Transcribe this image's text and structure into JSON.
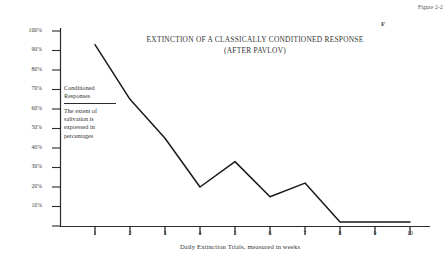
{
  "figure": {
    "caption": "Figure 2-2",
    "stray_mark": "F"
  },
  "chart_data": {
    "type": "line",
    "title": "EXTINCTION OF A CLASSICALLY CONDITIONED RESPONSE",
    "subtitle": "(AFTER PAVLOV)",
    "xlabel": "Daily Extinction Trials, measured in weeks",
    "ylabel": "Conditioned Responses",
    "x": [
      1,
      2,
      3,
      4,
      5,
      6,
      7,
      8,
      9,
      10
    ],
    "categories": [
      "1",
      "2",
      "3",
      "4",
      "5",
      "6",
      "7",
      "8",
      "9",
      "10"
    ],
    "values": [
      93,
      65,
      45,
      20,
      33,
      15,
      22,
      2,
      2,
      2
    ],
    "series": [
      {
        "name": "Conditioned Responses",
        "values": [
          93,
          65,
          45,
          20,
          33,
          15,
          22,
          2,
          2,
          2
        ]
      }
    ],
    "ylim": [
      0,
      100
    ],
    "xlim": [
      0,
      10
    ],
    "ytick_labels": [
      "100%",
      "90%",
      "80%",
      "70%",
      "60%",
      "50%",
      "40%",
      "30%",
      "20%",
      "10%"
    ],
    "ytick_values": [
      100,
      90,
      80,
      70,
      60,
      50,
      40,
      30,
      20,
      10
    ],
    "grid": false,
    "legend": "none",
    "line_color": "#1a1a1a",
    "axis_color": "#2b2b2b"
  },
  "annotation": {
    "heading_line1": "Conditioned",
    "heading_line2": "Responses",
    "body_line1": "The extent of",
    "body_line2": "salivation is",
    "body_line3": "expressed in",
    "body_line4": "percentages"
  }
}
